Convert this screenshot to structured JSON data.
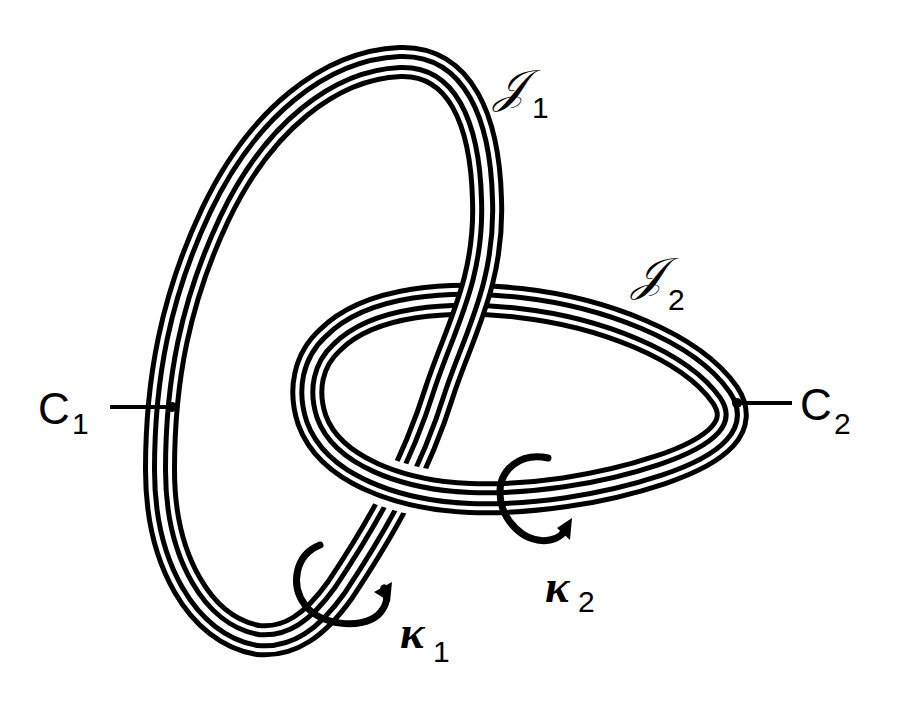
{
  "figure": {
    "type": "linked solid tori diagram",
    "colors": {
      "ink": "#000000",
      "paper": "#ffffff"
    }
  },
  "tori": [
    {
      "id": "J1",
      "label": "ȕ1",
      "symbol": "𝒥",
      "subscript": "1"
    },
    {
      "id": "J2",
      "label": "ȕ2",
      "symbol": "𝒥",
      "subscript": "2"
    }
  ],
  "curves": [
    {
      "id": "C1",
      "symbol": "C",
      "subscript": "1"
    },
    {
      "id": "C2",
      "symbol": "C",
      "subscript": "2"
    }
  ],
  "meridians": [
    {
      "id": "kappa1",
      "symbol": "κ",
      "subscript": "1"
    },
    {
      "id": "kappa2",
      "symbol": "κ",
      "subscript": "2"
    }
  ]
}
